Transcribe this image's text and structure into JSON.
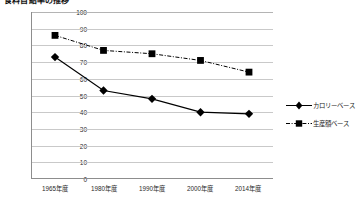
{
  "chart_title": "食料自給率の推移",
  "legend": {
    "position": "right",
    "items": [
      {
        "label": "カロリーベース",
        "marker": "diamond",
        "line": "solid",
        "color": "#000000"
      },
      {
        "label": "生産額ベース",
        "marker": "square",
        "line": "dash-dot",
        "color": "#000000"
      }
    ]
  },
  "chart_data": {
    "type": "line",
    "title": "食料自給率の推移",
    "xlabel": "",
    "ylabel": "",
    "categories": [
      "1965年度",
      "1980年度",
      "1990年度",
      "2000年度",
      "2014年度"
    ],
    "series": [
      {
        "name": "カロリーベース",
        "values": [
          73,
          53,
          48,
          40,
          39
        ],
        "marker": "diamond",
        "linestyle": "solid",
        "color": "#000000"
      },
      {
        "name": "生産額ベース",
        "values": [
          86,
          77,
          75,
          71,
          64
        ],
        "marker": "square",
        "linestyle": "dash-dot",
        "color": "#000000"
      }
    ],
    "ylim": [
      0,
      100
    ],
    "yticks": [
      0,
      10,
      20,
      30,
      40,
      50,
      60,
      70,
      80,
      90,
      100
    ],
    "ytick_labels": [
      "0",
      "10",
      "20",
      "30",
      "40",
      "50",
      "60",
      "70",
      "80",
      "90",
      "100"
    ],
    "grid": true,
    "grid_axis": "y",
    "legend_position": "right"
  },
  "axes": {
    "y_ticks": [
      "100",
      "90",
      "80",
      "70",
      "60",
      "50",
      "40",
      "30",
      "20",
      "10",
      "0"
    ],
    "x_ticks": [
      "1965年度",
      "1980年度",
      "1990年度",
      "2000年度",
      "2014年度"
    ]
  }
}
